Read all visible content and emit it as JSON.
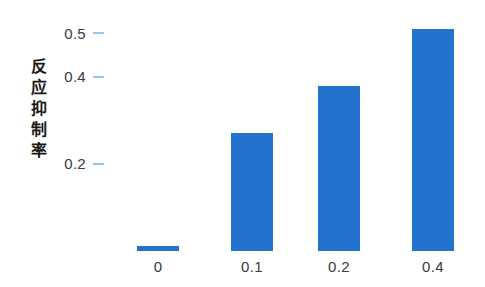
{
  "chart_data": {
    "type": "bar",
    "title": "",
    "xlabel": "",
    "ylabel": "反应抑制率",
    "categories": [
      "0",
      "0.1",
      "0.2",
      "0.4"
    ],
    "values": [
      0.011,
      0.27,
      0.378,
      0.51
    ],
    "ylim": [
      0,
      0.54
    ],
    "yticks": [
      0.2,
      0.4,
      0.5
    ],
    "ytick_labels": [
      "0.2",
      "0.4",
      "0.5"
    ],
    "grid": false,
    "legend": null,
    "series": [
      {
        "name": "反应抑制率",
        "values": [
          0.011,
          0.27,
          0.378,
          0.51
        ]
      }
    ],
    "colors": {
      "bar": "#2272CE",
      "tick_dash": "#9DC3E6",
      "text": "#3A3A3A",
      "axis_title": "#1A1A1A",
      "background": "#FFFFFF"
    }
  },
  "axis": {
    "y_title_chars": [
      "反",
      "应",
      "抑",
      "制",
      "率"
    ],
    "y_ticks": [
      {
        "label": "0.5",
        "value": 0.5
      },
      {
        "label": "0.4",
        "value": 0.4
      },
      {
        "label": "0.2",
        "value": 0.2
      }
    ],
    "x_ticks": [
      {
        "label": "0"
      },
      {
        "label": "0.1"
      },
      {
        "label": "0.2"
      },
      {
        "label": "0.4"
      }
    ]
  }
}
